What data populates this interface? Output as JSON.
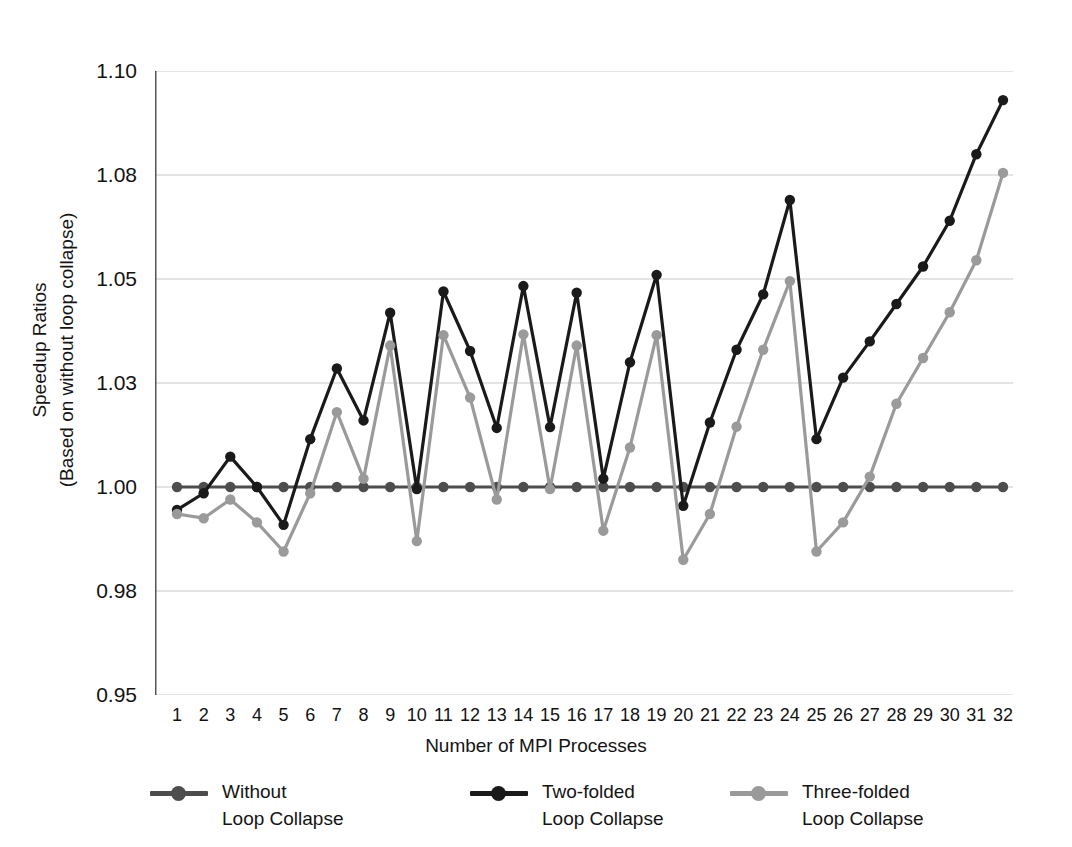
{
  "axes": {
    "ylabel_line1": "Speedup Ratios",
    "ylabel_line2": "(Based on without loop collapse)",
    "xlabel": "Number of MPI Processes"
  },
  "legend": [
    {
      "label": "Without\nLoop Collapse",
      "color": "#4d4d4d"
    },
    {
      "label": "Two-folded\nLoop Collapse",
      "color": "#1a1a1a"
    },
    {
      "label": "Three-folded\nLoop Collapse",
      "color": "#9a9a9a"
    }
  ],
  "chart_data": {
    "type": "line",
    "title": "",
    "xlabel": "Number of MPI Processes",
    "ylabel": "Speedup Ratios (Based on without loop collapse)",
    "x": [
      1,
      2,
      3,
      4,
      5,
      6,
      7,
      8,
      9,
      10,
      11,
      12,
      13,
      14,
      15,
      16,
      17,
      18,
      19,
      20,
      21,
      22,
      23,
      24,
      25,
      26,
      27,
      28,
      29,
      30,
      31,
      32
    ],
    "xtick_labels": [
      "1",
      "2",
      "3",
      "4",
      "5",
      "6",
      "7",
      "8",
      "9",
      "10",
      "11",
      "12",
      "13",
      "14",
      "15",
      "16",
      "17",
      "18",
      "19",
      "20",
      "21",
      "22",
      "23",
      "24",
      "25",
      "26",
      "27",
      "28",
      "29",
      "30",
      "31",
      "32"
    ],
    "ytick_labels": [
      "1.10",
      "1.08",
      "1.05",
      "1.03",
      "1.00",
      "0.98",
      "0.95"
    ],
    "ytick_values": [
      1.1,
      1.075,
      1.05,
      1.025,
      1.0,
      0.975,
      0.95
    ],
    "ylim": [
      0.95,
      1.1
    ],
    "grid": "horizontal",
    "legend_position": "bottom",
    "series": [
      {
        "name": "Without Loop Collapse",
        "color": "#4d4d4d",
        "values": [
          1.0,
          1.0,
          1.0,
          1.0,
          1.0,
          1.0,
          1.0,
          1.0,
          1.0,
          1.0,
          1.0,
          1.0,
          1.0,
          1.0,
          1.0,
          1.0,
          1.0,
          1.0,
          1.0,
          1.0,
          1.0,
          1.0,
          1.0,
          1.0,
          1.0,
          1.0,
          1.0,
          1.0,
          1.0,
          1.0,
          1.0,
          1.0
        ]
      },
      {
        "name": "Two-folded Loop Collapse",
        "color": "#1a1a1a",
        "values": [
          0.9945,
          0.9985,
          1.0073,
          1.0,
          0.9909,
          1.0115,
          1.0285,
          1.016,
          1.0419,
          0.9995,
          1.047,
          1.0327,
          1.0142,
          1.0483,
          1.0144,
          1.0467,
          1.002,
          1.03,
          1.051,
          0.9955,
          1.0155,
          1.033,
          1.0463,
          1.069,
          1.0115,
          1.0263,
          1.035,
          1.044,
          1.053,
          1.064,
          1.08,
          1.093
        ]
      },
      {
        "name": "Three-folded Loop Collapse",
        "color": "#9a9a9a",
        "values": [
          0.9935,
          0.9925,
          0.997,
          0.9915,
          0.9845,
          0.9985,
          1.018,
          1.002,
          1.034,
          0.987,
          1.0365,
          1.0215,
          0.997,
          1.0367,
          0.9995,
          1.034,
          0.9895,
          1.0095,
          1.0365,
          0.9825,
          0.9935,
          1.0145,
          1.033,
          1.0495,
          0.9845,
          0.9915,
          1.0025,
          1.02,
          1.031,
          1.042,
          1.0545,
          1.0755
        ]
      }
    ]
  }
}
